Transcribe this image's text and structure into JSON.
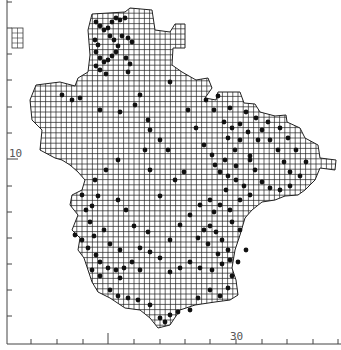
{
  "map": {
    "type": "grid-square distribution map",
    "grid_cell_px": 5.2,
    "axis": {
      "y_label": "10",
      "x_label": "30",
      "left_ticks_y": [
        2,
        28,
        54,
        80,
        107,
        133,
        159,
        186,
        212,
        238,
        264,
        290,
        316
      ],
      "bottom_ticks_x": [
        31,
        57,
        83,
        108,
        134,
        160,
        185,
        210,
        236,
        262,
        287,
        313,
        338
      ],
      "long_tick_y": 159,
      "long_tick_x": 108
    },
    "colors": {
      "grid": "#222222",
      "dot": "#111111",
      "axis": "#444444"
    },
    "outline": [
      [
        92,
        14
      ],
      [
        125,
        12
      ],
      [
        130,
        8
      ],
      [
        152,
        10
      ],
      [
        155,
        30
      ],
      [
        170,
        32
      ],
      [
        175,
        24
      ],
      [
        185,
        24
      ],
      [
        185,
        48
      ],
      [
        173,
        48
      ],
      [
        172,
        65
      ],
      [
        182,
        72
      ],
      [
        196,
        80
      ],
      [
        208,
        78
      ],
      [
        212,
        88
      ],
      [
        205,
        98
      ],
      [
        216,
        100
      ],
      [
        218,
        92
      ],
      [
        240,
        92
      ],
      [
        244,
        103
      ],
      [
        255,
        104
      ],
      [
        260,
        112
      ],
      [
        275,
        116
      ],
      [
        286,
        115
      ],
      [
        287,
        122
      ],
      [
        300,
        128
      ],
      [
        305,
        138
      ],
      [
        318,
        145
      ],
      [
        320,
        158
      ],
      [
        336,
        160
      ],
      [
        335,
        170
      ],
      [
        320,
        168
      ],
      [
        315,
        180
      ],
      [
        305,
        190
      ],
      [
        298,
        195
      ],
      [
        285,
        196
      ],
      [
        275,
        200
      ],
      [
        262,
        202
      ],
      [
        252,
        210
      ],
      [
        245,
        218
      ],
      [
        240,
        235
      ],
      [
        235,
        250
      ],
      [
        232,
        268
      ],
      [
        236,
        280
      ],
      [
        238,
        295
      ],
      [
        230,
        300
      ],
      [
        215,
        302
      ],
      [
        195,
        305
      ],
      [
        180,
        310
      ],
      [
        170,
        325
      ],
      [
        158,
        328
      ],
      [
        150,
        318
      ],
      [
        140,
        310
      ],
      [
        125,
        308
      ],
      [
        110,
        298
      ],
      [
        98,
        292
      ],
      [
        92,
        282
      ],
      [
        88,
        270
      ],
      [
        84,
        258
      ],
      [
        78,
        250
      ],
      [
        80,
        238
      ],
      [
        72,
        230
      ],
      [
        78,
        215
      ],
      [
        70,
        205
      ],
      [
        72,
        195
      ],
      [
        82,
        190
      ],
      [
        85,
        180
      ],
      [
        78,
        172
      ],
      [
        70,
        165
      ],
      [
        62,
        160
      ],
      [
        55,
        158
      ],
      [
        40,
        150
      ],
      [
        42,
        130
      ],
      [
        32,
        120
      ],
      [
        30,
        100
      ],
      [
        36,
        85
      ],
      [
        60,
        82
      ],
      [
        75,
        86
      ],
      [
        78,
        78
      ],
      [
        88,
        72
      ],
      [
        90,
        55
      ],
      [
        88,
        30
      ]
    ],
    "inset": {
      "x": 12,
      "y": 28,
      "w": 11,
      "h": 20
    },
    "dots": [
      [
        96,
        22
      ],
      [
        100,
        26
      ],
      [
        104,
        30
      ],
      [
        108,
        28
      ],
      [
        112,
        22
      ],
      [
        116,
        18
      ],
      [
        120,
        20
      ],
      [
        125,
        18
      ],
      [
        95,
        40
      ],
      [
        98,
        45
      ],
      [
        96,
        52
      ],
      [
        100,
        58
      ],
      [
        104,
        62
      ],
      [
        108,
        60
      ],
      [
        112,
        56
      ],
      [
        116,
        52
      ],
      [
        118,
        46
      ],
      [
        114,
        40
      ],
      [
        110,
        36
      ],
      [
        122,
        36
      ],
      [
        128,
        38
      ],
      [
        132,
        42
      ],
      [
        126,
        58
      ],
      [
        130,
        64
      ],
      [
        128,
        72
      ],
      [
        100,
        70
      ],
      [
        96,
        66
      ],
      [
        106,
        74
      ],
      [
        62,
        95
      ],
      [
        72,
        100
      ],
      [
        80,
        98
      ],
      [
        100,
        110
      ],
      [
        120,
        112
      ],
      [
        135,
        105
      ],
      [
        150,
        130
      ],
      [
        145,
        150
      ],
      [
        118,
        160
      ],
      [
        106,
        170
      ],
      [
        95,
        180
      ],
      [
        82,
        195
      ],
      [
        86,
        210
      ],
      [
        90,
        222
      ],
      [
        75,
        235
      ],
      [
        82,
        240
      ],
      [
        88,
        248
      ],
      [
        96,
        255
      ],
      [
        100,
        262
      ],
      [
        108,
        268
      ],
      [
        116,
        270
      ],
      [
        124,
        268
      ],
      [
        132,
        262
      ],
      [
        140,
        270
      ],
      [
        120,
        278
      ],
      [
        100,
        276
      ],
      [
        92,
        270
      ],
      [
        110,
        290
      ],
      [
        118,
        296
      ],
      [
        128,
        298
      ],
      [
        138,
        300
      ],
      [
        150,
        305
      ],
      [
        160,
        318
      ],
      [
        165,
        322
      ],
      [
        170,
        315
      ],
      [
        178,
        312
      ],
      [
        190,
        310
      ],
      [
        198,
        298
      ],
      [
        210,
        290
      ],
      [
        220,
        296
      ],
      [
        228,
        288
      ],
      [
        232,
        276
      ],
      [
        230,
        260
      ],
      [
        228,
        250
      ],
      [
        222,
        240
      ],
      [
        216,
        232
      ],
      [
        210,
        226
      ],
      [
        204,
        230
      ],
      [
        198,
        238
      ],
      [
        208,
        244
      ],
      [
        218,
        254
      ],
      [
        222,
        264
      ],
      [
        212,
        270
      ],
      [
        200,
        268
      ],
      [
        190,
        262
      ],
      [
        180,
        268
      ],
      [
        170,
        272
      ],
      [
        160,
        258
      ],
      [
        150,
        252
      ],
      [
        140,
        248
      ],
      [
        170,
        240
      ],
      [
        180,
        225
      ],
      [
        190,
        215
      ],
      [
        200,
        205
      ],
      [
        210,
        200
      ],
      [
        220,
        205
      ],
      [
        230,
        210
      ],
      [
        240,
        200
      ],
      [
        250,
        195
      ],
      [
        244,
        186
      ],
      [
        236,
        180
      ],
      [
        228,
        176
      ],
      [
        220,
        172
      ],
      [
        215,
        165
      ],
      [
        225,
        160
      ],
      [
        235,
        150
      ],
      [
        240,
        140
      ],
      [
        232,
        128
      ],
      [
        224,
        122
      ],
      [
        214,
        110
      ],
      [
        206,
        100
      ],
      [
        218,
        96
      ],
      [
        230,
        108
      ],
      [
        246,
        112
      ],
      [
        256,
        118
      ],
      [
        262,
        130
      ],
      [
        270,
        140
      ],
      [
        278,
        150
      ],
      [
        284,
        162
      ],
      [
        290,
        172
      ],
      [
        300,
        176
      ],
      [
        306,
        162
      ],
      [
        296,
        150
      ],
      [
        288,
        138
      ],
      [
        280,
        128
      ],
      [
        268,
        122
      ],
      [
        258,
        140
      ],
      [
        250,
        156
      ],
      [
        255,
        170
      ],
      [
        262,
        182
      ],
      [
        270,
        188
      ],
      [
        280,
        190
      ],
      [
        290,
        186
      ],
      [
        184,
        172
      ],
      [
        175,
        180
      ],
      [
        168,
        150
      ],
      [
        160,
        140
      ],
      [
        148,
        120
      ],
      [
        140,
        95
      ],
      [
        170,
        82
      ],
      [
        188,
        110
      ],
      [
        196,
        128
      ],
      [
        204,
        145
      ],
      [
        212,
        155
      ],
      [
        228,
        138
      ],
      [
        240,
        124
      ],
      [
        248,
        132
      ],
      [
        250,
        160
      ],
      [
        236,
        166
      ],
      [
        226,
        190
      ],
      [
        214,
        212
      ],
      [
        232,
        222
      ],
      [
        240,
        230
      ],
      [
        246,
        250
      ],
      [
        238,
        262
      ],
      [
        134,
        226
      ],
      [
        126,
        210
      ],
      [
        118,
        200
      ],
      [
        104,
        230
      ],
      [
        94,
        236
      ],
      [
        110,
        244
      ],
      [
        120,
        250
      ],
      [
        148,
        232
      ],
      [
        160,
        196
      ],
      [
        150,
        170
      ],
      [
        98,
        196
      ],
      [
        92,
        206
      ]
    ]
  }
}
